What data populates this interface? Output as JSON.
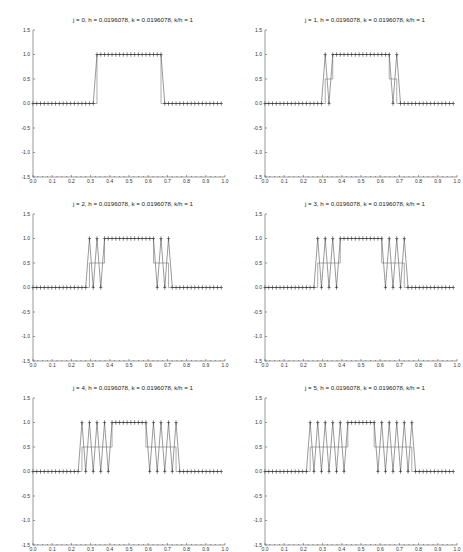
{
  "chart_data": [
    {
      "type": "line",
      "title": "j = 0, h = 0.0196078, k = 0.0196078, k/h = 1",
      "j": 0,
      "xlim": [
        0.0,
        1.0
      ],
      "ylim": [
        -1.5,
        1.5
      ],
      "xticks": [
        "0.0",
        "0.1",
        "0.2",
        "0.3",
        "0.4",
        "0.5",
        "0.6",
        "0.7",
        "0.8",
        "0.9",
        "1.0"
      ],
      "yticks": [
        "1.5",
        "1.0",
        "0.5",
        "0.0",
        "-0.5",
        "-1.0",
        "-1.5"
      ],
      "h": 0.0196078,
      "series": [
        {
          "name": "numerical",
          "marker": "+",
          "values": [
            0,
            0,
            0,
            0,
            0,
            0,
            0,
            0,
            0,
            0,
            0,
            0,
            0,
            0,
            0,
            0,
            0,
            1,
            1,
            1,
            1,
            1,
            1,
            1,
            1,
            1,
            1,
            1,
            1,
            1,
            1,
            1,
            1,
            1,
            1,
            0,
            0,
            0,
            0,
            0,
            0,
            0,
            0,
            0,
            0,
            0,
            0,
            0,
            0,
            0,
            0
          ]
        },
        {
          "name": "exact",
          "marker": "none",
          "x": [
            0,
            0.3333,
            0.3333,
            0.6667,
            0.6667,
            0.98
          ],
          "y": [
            0,
            0,
            1,
            1,
            0,
            0
          ]
        }
      ]
    },
    {
      "type": "line",
      "title": "j = 1, h = 0.0196078, k = 0.0196078, k/h = 1",
      "j": 1,
      "xlim": [
        0.0,
        1.0
      ],
      "ylim": [
        -1.5,
        1.5
      ],
      "xticks": [
        "0.0",
        "0.1",
        "0.2",
        "0.3",
        "0.4",
        "0.5",
        "0.6",
        "0.7",
        "0.8",
        "0.9",
        "1.0"
      ],
      "yticks": [
        "1.5",
        "1.0",
        "0.5",
        "0.0",
        "-0.5",
        "-1.0",
        "-1.5"
      ],
      "h": 0.0196078,
      "series": [
        {
          "name": "numerical",
          "marker": "+",
          "values": [
            0,
            0,
            0,
            0,
            0,
            0,
            0,
            0,
            0,
            0,
            0,
            0,
            0,
            0,
            0,
            0,
            1,
            0,
            1,
            1,
            1,
            1,
            1,
            1,
            1,
            1,
            1,
            1,
            1,
            1,
            1,
            1,
            1,
            1,
            0,
            1,
            0,
            0,
            0,
            0,
            0,
            0,
            0,
            0,
            0,
            0,
            0,
            0,
            0,
            0,
            0
          ]
        },
        {
          "name": "exact",
          "marker": "none",
          "x": [
            0,
            0.3137,
            0.3137,
            0.3529,
            0.3529,
            0.6471,
            0.6471,
            0.6863,
            0.6863,
            0.98
          ],
          "y": [
            0,
            0,
            0.5,
            0.5,
            1,
            1,
            0.5,
            0.5,
            0,
            0
          ]
        }
      ]
    },
    {
      "type": "line",
      "title": "j = 2, h = 0.0196078, k = 0.0196078, k/h = 1",
      "j": 2,
      "xlim": [
        0.0,
        1.0
      ],
      "ylim": [
        -1.5,
        1.5
      ],
      "xticks": [
        "0.0",
        "0.1",
        "0.2",
        "0.3",
        "0.4",
        "0.5",
        "0.6",
        "0.7",
        "0.8",
        "0.9",
        "1.0"
      ],
      "yticks": [
        "1.5",
        "1.0",
        "0.5",
        "0.0",
        "-0.5",
        "-1.0",
        "-1.5"
      ],
      "h": 0.0196078,
      "series": [
        {
          "name": "numerical",
          "marker": "+",
          "values": [
            0,
            0,
            0,
            0,
            0,
            0,
            0,
            0,
            0,
            0,
            0,
            0,
            0,
            0,
            0,
            1,
            0,
            1,
            0,
            1,
            1,
            1,
            1,
            1,
            1,
            1,
            1,
            1,
            1,
            1,
            1,
            1,
            1,
            0,
            1,
            0,
            1,
            0,
            0,
            0,
            0,
            0,
            0,
            0,
            0,
            0,
            0,
            0,
            0,
            0,
            0
          ]
        },
        {
          "name": "exact",
          "marker": "none",
          "x": [
            0,
            0.2941,
            0.2941,
            0.3725,
            0.3725,
            0.6275,
            0.6275,
            0.7059,
            0.7059,
            0.98
          ],
          "y": [
            0,
            0,
            0.5,
            0.5,
            1,
            1,
            0.5,
            0.5,
            0,
            0
          ]
        }
      ]
    },
    {
      "type": "line",
      "title": "j = 3, h = 0.0196078, k = 0.0196078, k/h = 1",
      "j": 3,
      "xlim": [
        0.0,
        1.0
      ],
      "ylim": [
        -1.5,
        1.5
      ],
      "xticks": [
        "0.0",
        "0.1",
        "0.2",
        "0.3",
        "0.4",
        "0.5",
        "0.6",
        "0.7",
        "0.8",
        "0.9",
        "1.0"
      ],
      "yticks": [
        "1.5",
        "1.0",
        "0.5",
        "0.0",
        "-0.5",
        "-1.0",
        "-1.5"
      ],
      "h": 0.0196078,
      "series": [
        {
          "name": "numerical",
          "marker": "+",
          "values": [
            0,
            0,
            0,
            0,
            0,
            0,
            0,
            0,
            0,
            0,
            0,
            0,
            0,
            0,
            1,
            0,
            1,
            0,
            1,
            0,
            1,
            1,
            1,
            1,
            1,
            1,
            1,
            1,
            1,
            1,
            1,
            1,
            0,
            1,
            0,
            1,
            0,
            1,
            0,
            0,
            0,
            0,
            0,
            0,
            0,
            0,
            0,
            0,
            0,
            0,
            0
          ]
        },
        {
          "name": "exact",
          "marker": "none",
          "x": [
            0,
            0.2745,
            0.2745,
            0.3922,
            0.3922,
            0.6078,
            0.6078,
            0.7255,
            0.7255,
            0.98
          ],
          "y": [
            0,
            0,
            0.5,
            0.5,
            1,
            1,
            0.5,
            0.5,
            0,
            0
          ]
        }
      ]
    },
    {
      "type": "line",
      "title": "j = 4, h = 0.0196078, k = 0.0196078, k/h = 1",
      "j": 4,
      "xlim": [
        0.0,
        1.0
      ],
      "ylim": [
        -1.5,
        1.5
      ],
      "xticks": [
        "0.0",
        "0.1",
        "0.2",
        "0.3",
        "0.4",
        "0.5",
        "0.6",
        "0.7",
        "0.8",
        "0.9",
        "1.0"
      ],
      "yticks": [
        "1.5",
        "1.0",
        "0.5",
        "0.0",
        "-0.5",
        "-1.0",
        "-1.5"
      ],
      "h": 0.0196078,
      "series": [
        {
          "name": "numerical",
          "marker": "+",
          "values": [
            0,
            0,
            0,
            0,
            0,
            0,
            0,
            0,
            0,
            0,
            0,
            0,
            0,
            1,
            0,
            1,
            0,
            1,
            0,
            1,
            0,
            1,
            1,
            1,
            1,
            1,
            1,
            1,
            1,
            1,
            1,
            0,
            1,
            0,
            1,
            0,
            1,
            0,
            1,
            0,
            0,
            0,
            0,
            0,
            0,
            0,
            0,
            0,
            0,
            0,
            0
          ]
        },
        {
          "name": "exact",
          "marker": "none",
          "x": [
            0,
            0.2549,
            0.2549,
            0.4118,
            0.4118,
            0.5882,
            0.5882,
            0.7451,
            0.7451,
            0.98
          ],
          "y": [
            0,
            0,
            0.5,
            0.5,
            1,
            1,
            0.5,
            0.5,
            0,
            0
          ]
        }
      ]
    },
    {
      "type": "line",
      "title": "j = 5, h = 0.0196078, k = 0.0196078, k/h = 1",
      "j": 5,
      "xlim": [
        0.0,
        1.0
      ],
      "ylim": [
        -1.5,
        1.5
      ],
      "xticks": [
        "0.0",
        "0.1",
        "0.2",
        "0.3",
        "0.4",
        "0.5",
        "0.6",
        "0.7",
        "0.8",
        "0.9",
        "1.0"
      ],
      "yticks": [
        "1.5",
        "1.0",
        "0.5",
        "0.0",
        "-0.5",
        "-1.0",
        "-1.5"
      ],
      "h": 0.0196078,
      "series": [
        {
          "name": "numerical",
          "marker": "+",
          "values": [
            0,
            0,
            0,
            0,
            0,
            0,
            0,
            0,
            0,
            0,
            0,
            0,
            1,
            0,
            1,
            0,
            1,
            0,
            1,
            0,
            1,
            0,
            1,
            1,
            1,
            1,
            1,
            1,
            1,
            1,
            0,
            1,
            0,
            1,
            0,
            1,
            0,
            1,
            0,
            1,
            0,
            0,
            0,
            0,
            0,
            0,
            0,
            0,
            0,
            0,
            0
          ]
        },
        {
          "name": "exact",
          "marker": "none",
          "x": [
            0,
            0.2353,
            0.2353,
            0.4314,
            0.4314,
            0.5686,
            0.5686,
            0.7647,
            0.7647,
            0.98
          ],
          "y": [
            0,
            0,
            0.5,
            0.5,
            1,
            1,
            0.5,
            0.5,
            0,
            0
          ]
        }
      ]
    }
  ]
}
